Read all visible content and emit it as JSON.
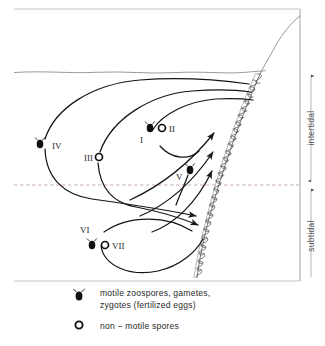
{
  "figure": {
    "colors": {
      "ink": "#1a1a1a",
      "line": "#2a2a2a",
      "faint": "#9a9a9a",
      "dashed": "#b08f8f",
      "background": "#ffffff"
    },
    "zones": [
      {
        "name": "intertidal-zone-label",
        "label": "intertidal"
      },
      {
        "name": "subtidal-zone-label",
        "label": "subtidal"
      }
    ],
    "stage_labels": [
      {
        "id": "I",
        "label": "I",
        "symbol": "motile",
        "x": 147,
        "y": 140
      },
      {
        "id": "II",
        "label": "II",
        "symbol": "non-motile",
        "x": 178,
        "y": 128
      },
      {
        "id": "III",
        "label": "III",
        "symbol": "non-motile",
        "x": 84,
        "y": 158
      },
      {
        "id": "IV",
        "label": "IV",
        "symbol": "motile",
        "x": 52,
        "y": 145
      },
      {
        "id": "V",
        "label": "V",
        "symbol": "motile",
        "x": 178,
        "y": 175
      },
      {
        "id": "VI",
        "label": "VI",
        "symbol": "none",
        "x": 83,
        "y": 228
      },
      {
        "id": "VII",
        "label": "VII",
        "symbol": "non-motile",
        "x": 117,
        "y": 245
      }
    ],
    "legend": [
      {
        "name": "legend-motile",
        "symbol": "motile-spore-icon",
        "line1": "motile  zoospores, gametes,",
        "line2": "zygotes  (fertilized eggs)"
      },
      {
        "name": "legend-non-motile",
        "symbol": "non-motile-spore-icon",
        "line1": "non − motile  spores",
        "line2": ""
      }
    ],
    "features": {
      "water_surface": "wavy water surface line",
      "tide_divider": "dashed low-tide line",
      "shore": "diagonal rocky shore with algal turf"
    }
  }
}
